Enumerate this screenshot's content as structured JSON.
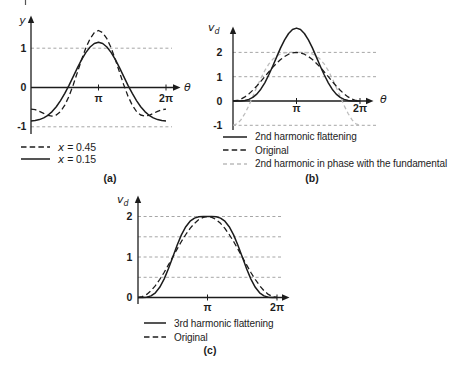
{
  "figure": {
    "captions": {
      "a": "(a)",
      "b": "(b)",
      "c": "(c)"
    }
  },
  "chart_data": [
    {
      "id": "a",
      "type": "line",
      "title": "",
      "xlabel": "θ",
      "ylabel": "y",
      "x_range_pi": [
        0,
        2
      ],
      "x_tick_labels": [
        "π",
        "2π"
      ],
      "y_tick_labels": [
        "1",
        "0",
        "-1"
      ],
      "y_tick_values": [
        1,
        0,
        -1
      ],
      "gridlines_y": [
        1,
        -1
      ],
      "ylim": [
        -1.5,
        1.8
      ],
      "sampling": "y sampled uniformly in θ from 0 to 2π",
      "series": [
        {
          "name": "x = 0.15",
          "style": "solid",
          "y": [
            -0.85,
            -0.842,
            -0.818,
            -0.774,
            -0.707,
            -0.613,
            -0.489,
            -0.334,
            -0.15,
            0.057,
            0.277,
            0.498,
            0.707,
            0.889,
            1.03,
            1.119,
            1.15,
            1.119,
            1.03,
            0.889,
            0.707,
            0.498,
            0.277,
            0.057,
            -0.15,
            -0.334,
            -0.489,
            -0.613,
            -0.707,
            -0.774,
            -0.818,
            -0.842,
            -0.85
          ]
        },
        {
          "name": "x = 0.45",
          "style": "dashed",
          "y": [
            -0.55,
            -0.565,
            -0.606,
            -0.659,
            -0.707,
            -0.728,
            -0.701,
            -0.611,
            -0.45,
            -0.221,
            0.064,
            0.383,
            0.707,
            1.004,
            1.242,
            1.397,
            1.45,
            1.397,
            1.242,
            1.004,
            0.707,
            0.383,
            0.064,
            -0.221,
            -0.45,
            -0.611,
            -0.701,
            -0.728,
            -0.707,
            -0.659,
            -0.606,
            -0.565,
            -0.55
          ]
        }
      ],
      "legend": [
        {
          "sym": "x",
          "rest": "= 0.45",
          "style": "dashed"
        },
        {
          "sym": "x",
          "rest": "= 0.15",
          "style": "solid"
        }
      ]
    },
    {
      "id": "b",
      "type": "line",
      "title": "",
      "xlabel": "θ",
      "ylabel": "vd",
      "ylabel_main": "v",
      "ylabel_sub": "d",
      "x_range_pi": [
        0,
        2
      ],
      "x_tick_labels": [
        "π",
        "2π"
      ],
      "y_tick_labels": [
        "2",
        "1",
        "0",
        "-1"
      ],
      "y_tick_values": [
        2,
        1,
        0,
        -1
      ],
      "gridlines_y": [
        2,
        1,
        -1
      ],
      "ylim": [
        -1.3,
        3.2
      ],
      "sampling": "y sampled uniformly in θ from 0 to 2π",
      "series": [
        {
          "name": "2nd harmonic flattening",
          "style": "solid",
          "y": [
            0,
            0,
            0.004,
            0.021,
            0.064,
            0.148,
            0.286,
            0.486,
            0.75,
            1.071,
            1.434,
            1.815,
            2.186,
            2.516,
            2.776,
            2.943,
            3,
            2.943,
            2.776,
            2.516,
            2.186,
            1.815,
            1.434,
            1.071,
            0.75,
            0.486,
            0.286,
            0.148,
            0.064,
            0.021,
            0.004,
            0,
            0
          ]
        },
        {
          "name": "Original",
          "style": "dashed",
          "y": [
            0,
            0.019,
            0.076,
            0.169,
            0.293,
            0.444,
            0.617,
            0.805,
            1,
            1.195,
            1.383,
            1.556,
            1.707,
            1.831,
            1.924,
            1.981,
            2,
            1.981,
            1.924,
            1.831,
            1.707,
            1.556,
            1.383,
            1.195,
            1,
            0.805,
            0.617,
            0.444,
            0.293,
            0.169,
            0.076,
            0.019,
            0
          ]
        },
        {
          "name": "2nd harmonic in phase with the fundamental",
          "style": "light",
          "y": [
            -1,
            -0.943,
            -0.776,
            -0.516,
            -0.186,
            0.185,
            0.566,
            0.929,
            1.25,
            1.514,
            1.714,
            1.852,
            1.936,
            1.979,
            1.996,
            2,
            2,
            2,
            1.996,
            1.979,
            1.936,
            1.852,
            1.714,
            1.514,
            1.25,
            0.929,
            0.566,
            0.185,
            -0.186,
            -0.516,
            -0.776,
            -0.943,
            -1
          ]
        }
      ],
      "legend": [
        {
          "label": "2nd harmonic flattening",
          "style": "solid"
        },
        {
          "label": "Original",
          "style": "dashed"
        },
        {
          "label": "2nd harmonic in phase with the fundamental",
          "style": "light"
        }
      ]
    },
    {
      "id": "c",
      "type": "line",
      "title": "",
      "xlabel": "",
      "ylabel": "vd",
      "ylabel_main": "v",
      "ylabel_sub": "d",
      "x_range_pi": [
        0,
        2
      ],
      "x_tick_labels": [
        "π",
        "2π"
      ],
      "y_tick_labels": [
        "2",
        "1",
        "0"
      ],
      "y_tick_values": [
        2,
        1,
        0
      ],
      "gridlines_y": [
        2,
        1.5,
        1,
        0.5
      ],
      "ylim": [
        0,
        2.4
      ],
      "sampling": "y sampled uniformly in θ from 0 to 2π",
      "series": [
        {
          "name": "3rd harmonic flattening",
          "style": "solid",
          "y": [
            0,
            0.001,
            0.008,
            0.04,
            0.116,
            0.252,
            0.454,
            0.711,
            1,
            1.289,
            1.546,
            1.748,
            1.884,
            1.96,
            1.992,
            1.999,
            2,
            1.999,
            1.992,
            1.96,
            1.884,
            1.748,
            1.546,
            1.289,
            1,
            0.711,
            0.454,
            0.252,
            0.116,
            0.04,
            0.008,
            0.001,
            0
          ]
        },
        {
          "name": "Original",
          "style": "dashed",
          "y": [
            0,
            0.019,
            0.076,
            0.169,
            0.293,
            0.444,
            0.617,
            0.805,
            1,
            1.195,
            1.383,
            1.556,
            1.707,
            1.831,
            1.924,
            1.981,
            2,
            1.981,
            1.924,
            1.831,
            1.707,
            1.556,
            1.383,
            1.195,
            1,
            0.805,
            0.617,
            0.444,
            0.293,
            0.169,
            0.076,
            0.019,
            0
          ]
        }
      ],
      "legend": [
        {
          "label": "3rd harmonic flattening",
          "style": "solid"
        },
        {
          "label": "Original",
          "style": "dashed"
        }
      ]
    }
  ]
}
